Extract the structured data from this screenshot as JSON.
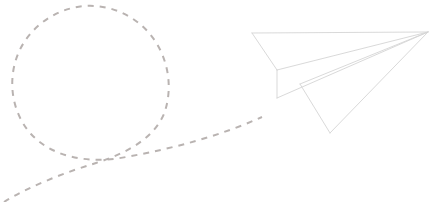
{
  "scene": {
    "title": "Paper plane with dashed flight trail",
    "width": 445,
    "height": 202,
    "background_color": "#ffffff",
    "alt_text": "A hand-drawn outline of a paper airplane flying to the upper right, trailing a light gray dashed looping flight path behind it"
  },
  "trail": {
    "name": "flight-path",
    "stroke_color": "#b9b3b1",
    "stroke_width": 2,
    "dash_length": 6,
    "gap_length": 6,
    "description": "Dashed looping flight path",
    "loop": {
      "center_x": 91,
      "center_y": 82,
      "radius": 77
    },
    "crossing_point_x": 110,
    "crossing_point_y": 158,
    "path_d": "M 4 202 C 30 186 66 172 96 163 C 130 152 154 137 164 114 C 172 92 170 66 157 44 C 142 19 114 4 85 6 C 56 8 29 27 18 54 C 7 81 12 113 31 134 C 53 158 90 164 126 157 C 176 148 222 135 262 117"
  },
  "plane": {
    "name": "paper-plane",
    "stroke_color": "#d5d5d5",
    "stroke_width": 0.9,
    "fill_color": "#ffffff",
    "tip_x": 428,
    "tip_y": 32,
    "points": {
      "nose": [
        428,
        32
      ],
      "top_wing_corner": [
        252,
        33
      ],
      "fold_vertex": [
        277,
        70
      ],
      "tail_corner": [
        277,
        98
      ],
      "bottom_vertex": [
        330,
        133
      ]
    },
    "segments": [
      {
        "name": "upper-wing-leading-edge",
        "d": "M 252 33 L 428 32"
      },
      {
        "name": "upper-wing-left-edge",
        "d": "M 252 33 L 277 70"
      },
      {
        "name": "upper-wing-trailing-edge",
        "d": "M 277 70 L 428 32"
      },
      {
        "name": "body-left-edge",
        "d": "M 277 70 L 277 98"
      },
      {
        "name": "body-keel-edge",
        "d": "M 277 98 L 428 32"
      },
      {
        "name": "lower-wing-fold",
        "d": "M 300 84 L 428 32"
      },
      {
        "name": "lower-wing-left-edge",
        "d": "M 300 84 L 330 133"
      },
      {
        "name": "lower-wing-trailing-edge",
        "d": "M 330 133 L 428 32"
      }
    ]
  }
}
